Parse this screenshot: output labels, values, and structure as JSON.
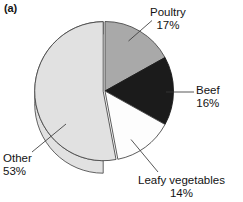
{
  "panel": {
    "label": "(a)"
  },
  "chart_data": {
    "type": "pie",
    "title": "",
    "subtitle": "",
    "xlabel": "",
    "ylabel": "",
    "legend_position": "none",
    "grid": false,
    "style": "3d-pie",
    "start_angle_deg": 0,
    "direction": "clockwise",
    "value_unit": "percent",
    "categories": [
      "Poultry",
      "Beef",
      "Leafy vegetables",
      "Other"
    ],
    "values": [
      17,
      16,
      14,
      53
    ],
    "labels": [
      "Poultry\n17%",
      "Beef\n16%",
      "Leafy vegetables\n14%",
      "Other\n53%"
    ],
    "colors": [
      "#a9a9a9",
      "#1b1b1b",
      "#fdfdfd",
      "#e1e1e1"
    ],
    "slices": [
      {
        "name": "Poultry",
        "label": "Poultry",
        "value": 17,
        "percent_text": "17%",
        "color": "#a9a9a9",
        "start_angle_deg": 0.0,
        "end_angle_deg": 61.2,
        "exploded": false,
        "leader_line": true
      },
      {
        "name": "Beef",
        "label": "Beef",
        "value": 16,
        "percent_text": "16%",
        "color": "#1b1b1b",
        "start_angle_deg": 61.2,
        "end_angle_deg": 118.8,
        "exploded": false,
        "leader_line": true
      },
      {
        "name": "Leafy vegetables",
        "label": "Leafy vegetables",
        "value": 14,
        "percent_text": "14%",
        "color": "#fdfdfd",
        "start_angle_deg": 118.8,
        "end_angle_deg": 169.2,
        "exploded": false,
        "leader_line": true
      },
      {
        "name": "Other",
        "label": "Other",
        "value": 53,
        "percent_text": "53%",
        "color": "#e1e1e1",
        "start_angle_deg": 169.2,
        "end_angle_deg": 360.0,
        "exploded": true,
        "leader_line": true
      }
    ]
  },
  "annotations": {
    "poultry": {
      "name": "Poultry",
      "percent": "17%"
    },
    "beef": {
      "name": "Beef",
      "percent": "16%"
    },
    "leafy": {
      "name": "Leafy vegetables",
      "percent": "14%"
    },
    "other": {
      "name": "Other",
      "percent": "53%"
    }
  },
  "colors": {
    "poultry": "#a9a9a9",
    "beef": "#1b1b1b",
    "leafy": "#fdfdfd",
    "other": "#e1e1e1",
    "outline": "#3c3c3c",
    "background": "#ffffff",
    "text": "#131313"
  }
}
